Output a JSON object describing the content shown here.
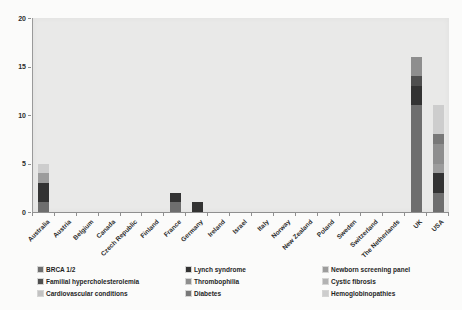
{
  "chart_data": {
    "type": "bar",
    "stacked": true,
    "title": "",
    "xlabel": "",
    "ylabel": "",
    "ylim": [
      0,
      20
    ],
    "yticks": [
      0,
      5,
      10,
      15,
      20
    ],
    "grid": false,
    "plot_bg_color": "#e9e9e8",
    "legend_position": "bottom",
    "categories": [
      "Australia",
      "Austria",
      "Belgium",
      "Canada",
      "Czech Republic",
      "Finland",
      "France",
      "Germany",
      "Ireland",
      "Israel",
      "Italy",
      "Norway",
      "New Zealand",
      "Poland",
      "Sweden",
      "Switzerland",
      "The Netherlands",
      "UK",
      "USA"
    ],
    "series": [
      {
        "name": "BRCA 1/2",
        "color": "#6e6e6e",
        "values": [
          1,
          0,
          0,
          0,
          0,
          0,
          1,
          0,
          0,
          0,
          0,
          0,
          0,
          0,
          0,
          0,
          0,
          11,
          2
        ]
      },
      {
        "name": "Lynch syndrome",
        "color": "#333333",
        "values": [
          2,
          0,
          0,
          0,
          0,
          0,
          1,
          1,
          0,
          0,
          0,
          0,
          0,
          0,
          0,
          0,
          0,
          2,
          2
        ]
      },
      {
        "name": "Newborn screening panel",
        "color": "#9c9c9c",
        "values": [
          1,
          0,
          0,
          0,
          0,
          0,
          0,
          0,
          0,
          0,
          0,
          0,
          0,
          0,
          0,
          0,
          0,
          0,
          1
        ]
      },
      {
        "name": "Familial hypercholesterolemia",
        "color": "#4f4f4f",
        "values": [
          0,
          0,
          0,
          0,
          0,
          0,
          0,
          0,
          0,
          0,
          0,
          0,
          0,
          0,
          0,
          0,
          0,
          1,
          0
        ]
      },
      {
        "name": "Thrombophilia",
        "color": "#8e8e8e",
        "values": [
          0,
          0,
          0,
          0,
          0,
          0,
          0,
          0,
          0,
          0,
          0,
          0,
          0,
          0,
          0,
          0,
          0,
          2,
          2
        ]
      },
      {
        "name": "Cystic fibrosis",
        "color": "#b3b3b3",
        "values": [
          0,
          0,
          0,
          0,
          0,
          0,
          0,
          0,
          0,
          0,
          0,
          0,
          0,
          0,
          0,
          0,
          0,
          0,
          0
        ]
      },
      {
        "name": "Cardiovascular conditions",
        "color": "#c2c2c2",
        "values": [
          0,
          0,
          0,
          0,
          0,
          0,
          0,
          0,
          0,
          0,
          0,
          0,
          0,
          0,
          0,
          0,
          0,
          0,
          0
        ]
      },
      {
        "name": "Diabetes",
        "color": "#787878",
        "values": [
          0,
          0,
          0,
          0,
          0,
          0,
          0,
          0,
          0,
          0,
          0,
          0,
          0,
          0,
          0,
          0,
          0,
          0,
          1
        ]
      },
      {
        "name": "Hemoglobinopathies",
        "color": "#cdcdcd",
        "values": [
          1,
          0,
          0,
          0,
          0,
          0,
          0,
          0,
          0,
          0,
          0,
          0,
          0,
          0,
          0,
          0,
          0,
          0,
          3
        ]
      }
    ],
    "legend_columns": [
      [
        "BRCA 1/2",
        "Familial hypercholesterolemia",
        "Cardiovascular conditions"
      ],
      [
        "Lynch syndrome",
        "Thrombophilia",
        "Diabetes"
      ],
      [
        "Newborn screening panel",
        "Cystic fibrosis",
        "Hemoglobinopathies"
      ]
    ]
  }
}
